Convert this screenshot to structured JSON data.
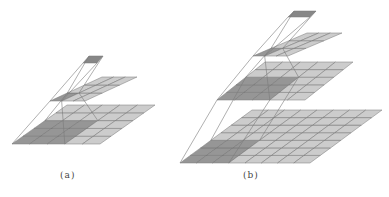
{
  "figure": {
    "colors": {
      "cell_light": "#c8c8c8",
      "cell_dark": "#8e8e8e",
      "grid_line": "#6e6e6e",
      "projection_line": "#7a7a7a",
      "top_cell": "#7d7d7d"
    },
    "panels": [
      {
        "id": "a",
        "caption": "(a)",
        "layers": [
          {
            "rows": 1,
            "cols": 1,
            "dark_rows": 1,
            "dark_cols": 1
          },
          {
            "rows": 3,
            "cols": 3,
            "dark_rows": 1,
            "dark_cols": 1
          },
          {
            "rows": 5,
            "cols": 5,
            "dark_rows": 3,
            "dark_cols": 3
          }
        ]
      },
      {
        "id": "b",
        "caption": "(b)",
        "layers": [
          {
            "rows": 1,
            "cols": 1,
            "dark_rows": 1,
            "dark_cols": 1
          },
          {
            "rows": 3,
            "cols": 3,
            "dark_rows": 1,
            "dark_cols": 1
          },
          {
            "rows": 5,
            "cols": 5,
            "dark_rows": 3,
            "dark_cols": 3
          },
          {
            "rows": 7,
            "cols": 8,
            "dark_rows": 3,
            "dark_cols": 3
          }
        ]
      }
    ]
  }
}
